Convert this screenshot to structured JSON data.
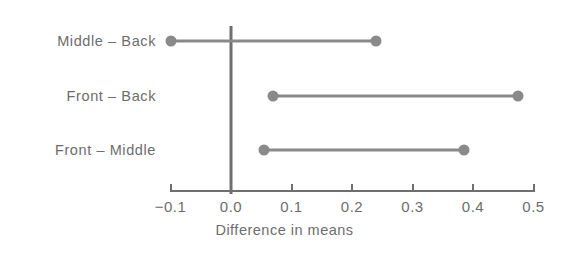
{
  "chart_data": {
    "type": "interval",
    "title": "",
    "subtitle": "",
    "xlabel": "Difference in means",
    "ylabel": "",
    "xlim": [
      -0.1,
      0.5
    ],
    "grid": false,
    "legend": null,
    "xticks": [
      -0.1,
      0.0,
      0.1,
      0.2,
      0.3,
      0.4,
      0.5
    ],
    "xtick_labels": [
      "−0.1",
      "0.0",
      "0.1",
      "0.2",
      "0.3",
      "0.4",
      "0.5"
    ],
    "reference_line": 0.0,
    "categories": [
      "Middle – Back",
      "Front – Back",
      "Front – Middle"
    ],
    "intervals": [
      {
        "label": "Middle – Back",
        "lower": -0.1,
        "upper": 0.24
      },
      {
        "label": "Front – Back",
        "lower": 0.07,
        "upper": 0.475
      },
      {
        "label": "Front – Middle",
        "lower": 0.055,
        "upper": 0.385
      }
    ],
    "colors": {
      "interval": "#8a8a8a",
      "endpoint": "#8a8a8a",
      "axis": "#6f6f6f",
      "reference_line": "#6f6f6f",
      "text": "#6d6d6d",
      "background": "#ffffff"
    }
  },
  "axis": {
    "title": "Difference in means",
    "tick_labels": [
      "−0.1",
      "0.0",
      "0.1",
      "0.2",
      "0.3",
      "0.4",
      "0.5"
    ]
  },
  "rows": [
    {
      "label": "Middle – Back"
    },
    {
      "label": "Front – Back"
    },
    {
      "label": "Front – Middle"
    }
  ]
}
